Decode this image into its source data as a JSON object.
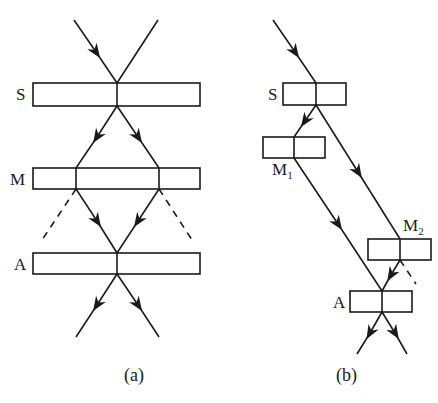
{
  "diagram_a": {
    "caption": "(a)",
    "labels": {
      "s": "S",
      "m": "M",
      "a": "A"
    }
  },
  "diagram_b": {
    "caption": "(b)",
    "labels": {
      "s": "S",
      "m1_base": "M",
      "m1_sub": "1",
      "m2_base": "M",
      "m2_sub": "2",
      "a": "A"
    }
  },
  "colors": {
    "stroke": "#1a1a1a",
    "background": "#ffffff"
  }
}
